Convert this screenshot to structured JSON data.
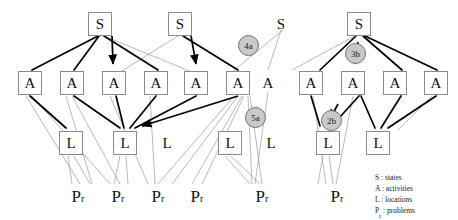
{
  "diagram": {
    "node_labels": {
      "state": "S",
      "activity": "A",
      "location": "L",
      "problem": "P",
      "problem_subscript": "r"
    },
    "colors": {
      "node_border": "#8a8a8a",
      "node_fill": "#ffffff",
      "edge_bold": "#000000",
      "edge_thin": "#9a9a9a",
      "badge_fill": "#c9c9c9",
      "badge_border": "#6e6e6e",
      "text": "#101010",
      "background": "#ffffff"
    },
    "levels": [
      {
        "name": "states",
        "label": "S",
        "y": 12,
        "nodes": [
          {
            "id": "s1",
            "label": "S",
            "x": 100,
            "boxed": true
          },
          {
            "id": "s2",
            "label": "S",
            "x": 180,
            "boxed": true
          },
          {
            "id": "s3",
            "label": "S",
            "x": 281,
            "boxed": false
          },
          {
            "id": "s4",
            "label": "S",
            "x": 359,
            "boxed": true
          }
        ]
      },
      {
        "name": "activities",
        "label": "A",
        "y": 72,
        "nodes": [
          {
            "id": "a1",
            "label": "A",
            "x": 18,
            "boxed": true
          },
          {
            "id": "a2",
            "label": "A",
            "x": 60,
            "boxed": true
          },
          {
            "id": "a3",
            "label": "A",
            "x": 102,
            "boxed": true
          },
          {
            "id": "a4",
            "label": "A",
            "x": 144,
            "boxed": true
          },
          {
            "id": "a5",
            "label": "A",
            "x": 186,
            "boxed": true
          },
          {
            "id": "a6",
            "label": "A",
            "x": 228,
            "boxed": true
          },
          {
            "id": "a7",
            "label": "A",
            "x": 266,
            "boxed": false
          },
          {
            "id": "a8",
            "label": "A",
            "x": 305,
            "boxed": true
          },
          {
            "id": "a9",
            "label": "A",
            "x": 347,
            "boxed": true
          },
          {
            "id": "a10",
            "label": "A",
            "x": 389,
            "boxed": true
          },
          {
            "id": "a11",
            "label": "A",
            "x": 428,
            "boxed": true
          }
        ]
      },
      {
        "name": "locations",
        "label": "L",
        "y": 132,
        "nodes": [
          {
            "id": "l1",
            "label": "L",
            "x": 60,
            "boxed": true
          },
          {
            "id": "l2",
            "label": "L",
            "x": 114,
            "boxed": true
          },
          {
            "id": "l3",
            "label": "L",
            "x": 167,
            "boxed": false
          },
          {
            "id": "l4",
            "label": "L",
            "x": 219,
            "boxed": true
          },
          {
            "id": "l5",
            "label": "L",
            "x": 271,
            "boxed": false
          },
          {
            "id": "l6",
            "label": "L",
            "x": 317,
            "boxed": true
          },
          {
            "id": "l7",
            "label": "L",
            "x": 367,
            "boxed": true
          }
        ]
      },
      {
        "name": "problems",
        "label": "P",
        "y": 190,
        "nodes": [
          {
            "id": "p1",
            "label": "P",
            "x": 64,
            "boxed": false
          },
          {
            "id": "p2",
            "label": "P",
            "x": 104,
            "boxed": false
          },
          {
            "id": "p3",
            "label": "P",
            "x": 144,
            "boxed": false
          },
          {
            "id": "p4",
            "label": "P",
            "x": 183,
            "boxed": false
          },
          {
            "id": "p5",
            "label": "P",
            "x": 248,
            "boxed": false
          },
          {
            "id": "p6",
            "label": "P",
            "x": 323,
            "boxed": false
          }
        ]
      }
    ],
    "badges": [
      {
        "id": "b4a",
        "label": "4a",
        "x": 238,
        "y": 35
      },
      {
        "id": "b3b",
        "label": "3b",
        "x": 345,
        "y": 43
      },
      {
        "id": "b5a",
        "label": "5a",
        "x": 245,
        "y": 107
      },
      {
        "id": "b2b",
        "label": "2b",
        "x": 321,
        "y": 110
      }
    ],
    "legend": {
      "rows": [
        {
          "key": "S",
          "sub": "",
          "sep": " : ",
          "value": "states"
        },
        {
          "key": "A",
          "sub": "",
          "sep": " : ",
          "value": "activities"
        },
        {
          "key": "L",
          "sub": "",
          "sep": " : ",
          "value": "locations"
        },
        {
          "key": "P",
          "sub": "r",
          "sep": " : ",
          "value": "problems"
        }
      ],
      "line1": "S : states",
      "line2": "A : activities",
      "line3": "L : locations",
      "line4": "P",
      "line4b": " : problems",
      "line4sub": "r"
    },
    "edges_bold": [
      [
        100,
        36,
        30,
        72
      ],
      [
        100,
        36,
        72,
        72
      ],
      [
        100,
        36,
        112,
        72
      ],
      [
        100,
        36,
        156,
        72
      ],
      [
        180,
        36,
        198,
        72
      ],
      [
        180,
        36,
        240,
        72
      ],
      [
        359,
        36,
        317,
        72
      ],
      [
        359,
        36,
        359,
        72
      ],
      [
        359,
        36,
        401,
        72
      ],
      [
        359,
        36,
        438,
        72
      ],
      [
        30,
        96,
        70,
        132
      ],
      [
        72,
        96,
        122,
        132
      ],
      [
        114,
        96,
        126,
        132
      ],
      [
        156,
        96,
        130,
        132
      ],
      [
        198,
        96,
        134,
        132
      ],
      [
        240,
        96,
        140,
        132
      ],
      [
        317,
        96,
        325,
        132
      ],
      [
        359,
        96,
        331,
        132
      ],
      [
        359,
        96,
        377,
        132
      ],
      [
        401,
        96,
        381,
        132
      ],
      [
        438,
        96,
        386,
        132
      ]
    ],
    "edges_thin": [
      [
        100,
        36,
        196,
        72
      ],
      [
        180,
        36,
        118,
        72
      ],
      [
        281,
        36,
        266,
        72
      ],
      [
        281,
        36,
        230,
        72
      ],
      [
        30,
        96,
        84,
        190
      ],
      [
        38,
        96,
        112,
        190
      ],
      [
        72,
        96,
        96,
        190
      ],
      [
        80,
        96,
        122,
        190
      ],
      [
        114,
        96,
        150,
        190
      ],
      [
        122,
        96,
        156,
        190
      ],
      [
        240,
        96,
        160,
        190
      ],
      [
        244,
        96,
        172,
        190
      ],
      [
        248,
        96,
        192,
        190
      ],
      [
        248,
        96,
        202,
        190
      ],
      [
        252,
        96,
        256,
        190
      ],
      [
        266,
        96,
        256,
        190
      ],
      [
        270,
        96,
        264,
        190
      ],
      [
        317,
        96,
        327,
        190
      ],
      [
        325,
        96,
        334,
        190
      ],
      [
        70,
        156,
        74,
        190
      ],
      [
        76,
        156,
        90,
        190
      ],
      [
        122,
        156,
        116,
        190
      ],
      [
        128,
        156,
        130,
        190
      ],
      [
        227,
        156,
        252,
        190
      ],
      [
        233,
        156,
        262,
        190
      ],
      [
        325,
        156,
        320,
        190
      ],
      [
        331,
        156,
        334,
        190
      ],
      [
        230,
        36,
        228,
        72
      ]
    ],
    "edges_arrow": [
      [
        100,
        36,
        114,
        66
      ],
      [
        180,
        36,
        198,
        66
      ],
      [
        359,
        52,
        352,
        66
      ],
      [
        240,
        96,
        140,
        128
      ],
      [
        305,
        96,
        321,
        124
      ],
      [
        347,
        104,
        333,
        120
      ]
    ]
  }
}
